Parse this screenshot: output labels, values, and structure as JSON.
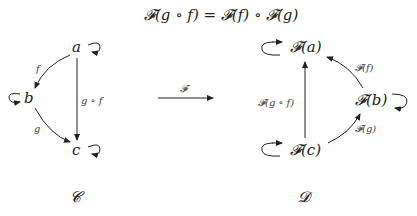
{
  "equation": "𝓕(g ∘ f) = 𝓕(f) ∘ 𝓕(g)",
  "source_category": {
    "name": "𝓒",
    "objects": {
      "a": "a",
      "b": "b",
      "c": "c"
    },
    "morphisms": {
      "f": "f",
      "g": "g",
      "gf": "g ∘ f"
    }
  },
  "functor": {
    "label": "𝓕"
  },
  "target_category": {
    "name": "𝓓",
    "objects": {
      "Fa": "𝓕(a)",
      "Fb": "𝓕(b)",
      "Fc": "𝓕(c)"
    },
    "morphisms": {
      "Ff": "𝓕(f)",
      "Fg": "𝓕(g)",
      "Fgf": "𝓕(g ∘ f)"
    }
  }
}
